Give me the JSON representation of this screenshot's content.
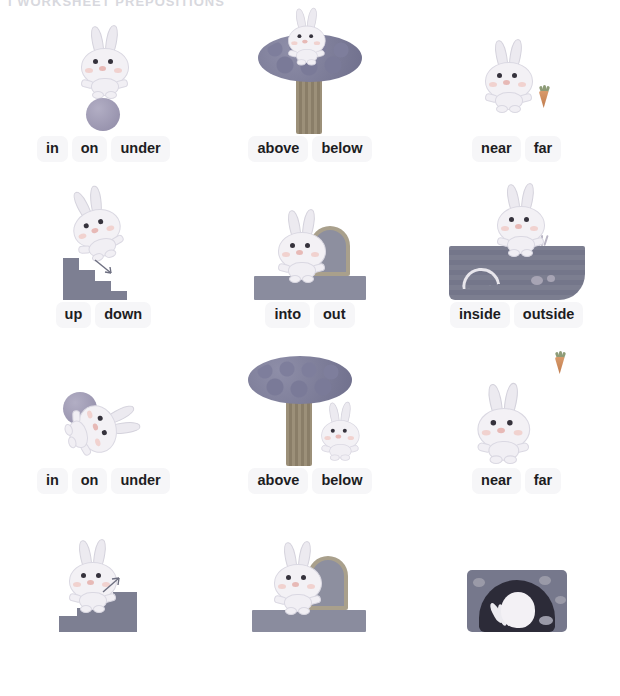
{
  "page": {
    "cut_header_text": "I WORKSHEET  PREPOSITIONS",
    "pill_bg": "#f6f6f8",
    "text_color": "#1d1d1f"
  },
  "panels": [
    {
      "id": "panel-1",
      "row": 1,
      "column": 1,
      "illustration": "rabbit-standing-on-ball",
      "options": [
        "in",
        "on",
        "under"
      ]
    },
    {
      "id": "panel-2",
      "row": 1,
      "column": 2,
      "illustration": "rabbit-above-tree",
      "options": [
        "above",
        "below"
      ]
    },
    {
      "id": "panel-3",
      "row": 1,
      "column": 3,
      "illustration": "rabbit-near-carrot",
      "options": [
        "near",
        "far"
      ]
    },
    {
      "id": "panel-4",
      "row": 2,
      "column": 1,
      "illustration": "rabbit-going-down-stairs",
      "options": [
        "up",
        "down"
      ]
    },
    {
      "id": "panel-5",
      "row": 2,
      "column": 2,
      "illustration": "rabbit-out-of-door",
      "options": [
        "into",
        "out"
      ]
    },
    {
      "id": "panel-6",
      "row": 2,
      "column": 3,
      "illustration": "rabbit-outside-burrow",
      "options": [
        "inside",
        "outside"
      ]
    },
    {
      "id": "panel-7",
      "row": 3,
      "column": 1,
      "illustration": "rabbit-under-ball",
      "options": [
        "in",
        "on",
        "under"
      ]
    },
    {
      "id": "panel-8",
      "row": 3,
      "column": 2,
      "illustration": "rabbit-below-tree",
      "options": [
        "above",
        "below"
      ]
    },
    {
      "id": "panel-9",
      "row": 3,
      "column": 3,
      "illustration": "rabbit-far-from-carrot",
      "options": [
        "near",
        "far"
      ]
    },
    {
      "id": "panel-10",
      "row": 4,
      "column": 1,
      "illustration": "rabbit-going-up-stairs",
      "options": []
    },
    {
      "id": "panel-11",
      "row": 4,
      "column": 2,
      "illustration": "rabbit-into-door",
      "options": []
    },
    {
      "id": "panel-12",
      "row": 4,
      "column": 3,
      "illustration": "rabbit-inside-burrow",
      "options": []
    }
  ]
}
